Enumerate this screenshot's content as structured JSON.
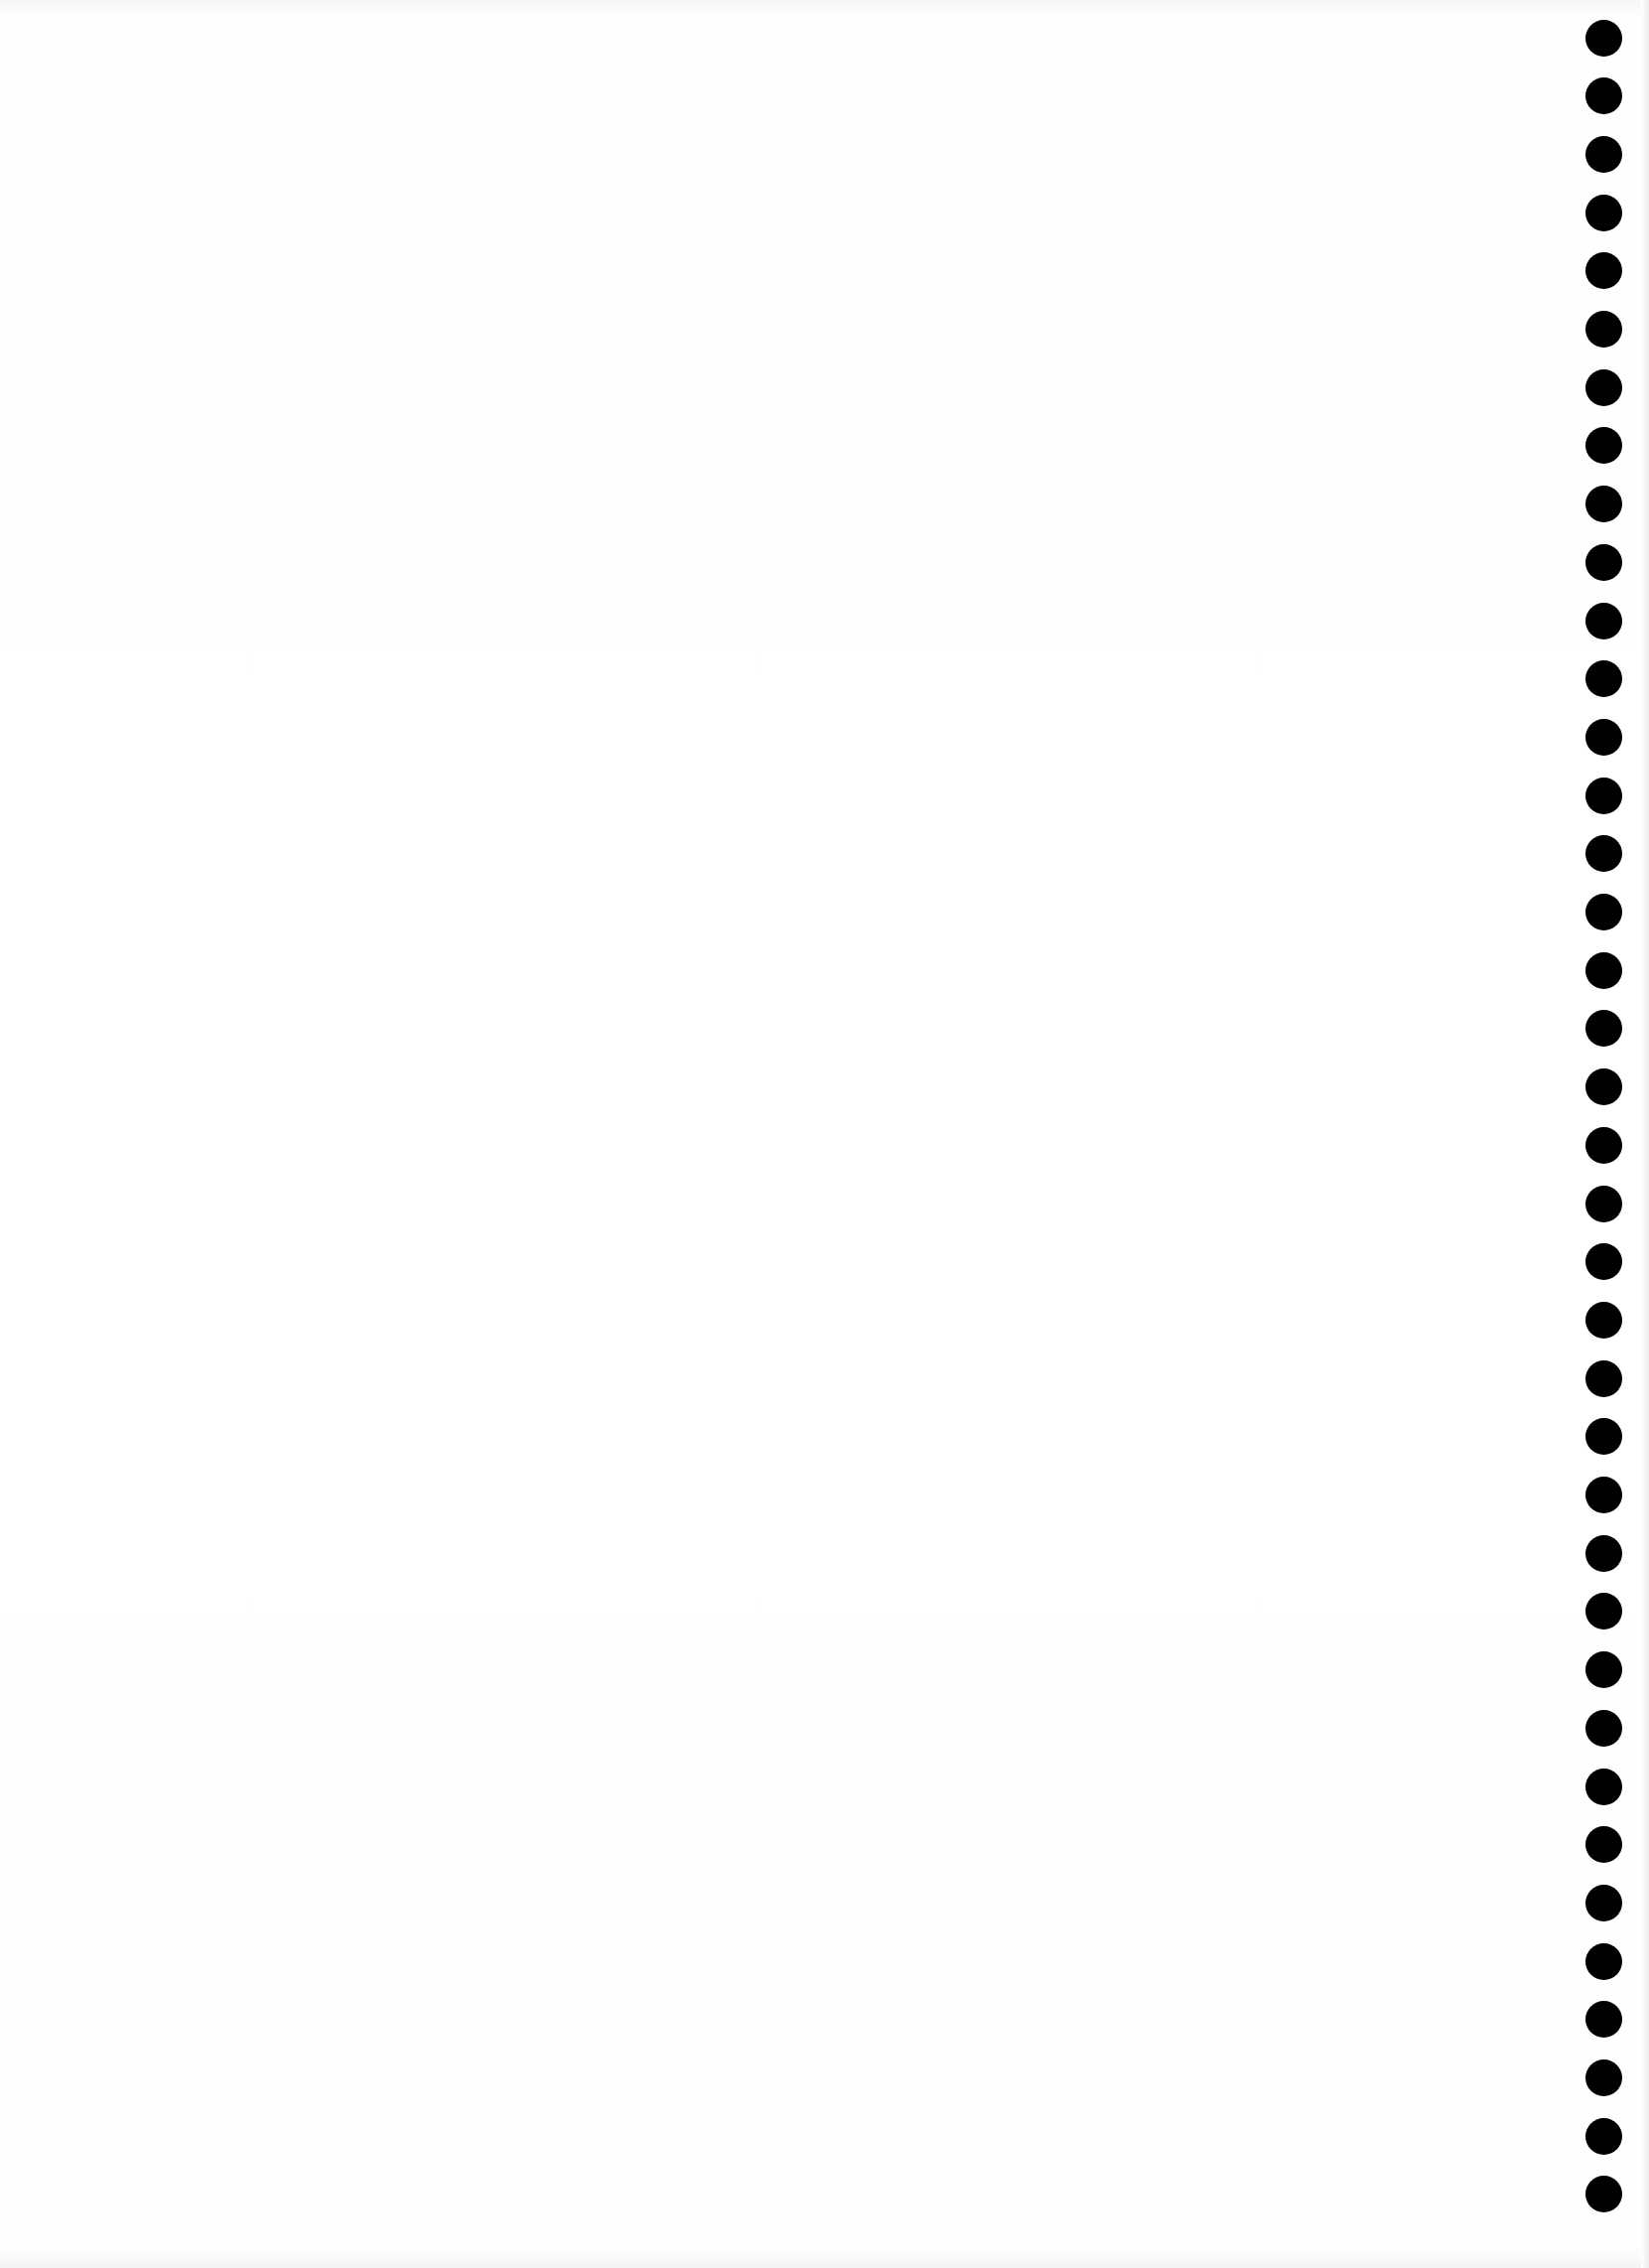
{
  "page": {
    "background": "#ffffff",
    "text_content": []
  },
  "punch_holes": {
    "count": 38,
    "center_x": 1615,
    "first_center_y": 38,
    "spacing_y": 58.7,
    "diameter": 37,
    "color": "#000000"
  }
}
